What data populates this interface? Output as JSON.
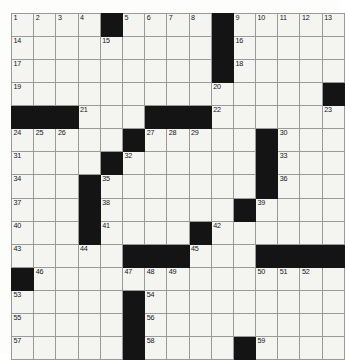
{
  "puzzle": {
    "title": "Crossword Grid",
    "rows": 15,
    "columns": 15,
    "cell_background": "#f4f4f1",
    "block_color": "#141414",
    "grid_line_color": "#9a9a98",
    "page_background": "#ffffff",
    "number_count": 59,
    "grid": [
      [
        {
          "block": false,
          "number": "1"
        },
        {
          "block": false,
          "number": "2"
        },
        {
          "block": false,
          "number": "3"
        },
        {
          "block": false,
          "number": "4"
        },
        {
          "block": true,
          "number": ""
        },
        {
          "block": false,
          "number": "5"
        },
        {
          "block": false,
          "number": "6"
        },
        {
          "block": false,
          "number": "7"
        },
        {
          "block": false,
          "number": "8"
        },
        {
          "block": true,
          "number": ""
        },
        {
          "block": false,
          "number": "9"
        },
        {
          "block": false,
          "number": "10"
        },
        {
          "block": false,
          "number": "11"
        },
        {
          "block": false,
          "number": "12"
        },
        {
          "block": false,
          "number": "13"
        }
      ],
      [
        {
          "block": false,
          "number": "14"
        },
        {
          "block": false,
          "number": ""
        },
        {
          "block": false,
          "number": ""
        },
        {
          "block": false,
          "number": ""
        },
        {
          "block": false,
          "number": "15"
        },
        {
          "block": false,
          "number": ""
        },
        {
          "block": false,
          "number": ""
        },
        {
          "block": false,
          "number": ""
        },
        {
          "block": false,
          "number": ""
        },
        {
          "block": true,
          "number": ""
        },
        {
          "block": false,
          "number": "16"
        },
        {
          "block": false,
          "number": ""
        },
        {
          "block": false,
          "number": ""
        },
        {
          "block": false,
          "number": ""
        },
        {
          "block": false,
          "number": ""
        }
      ],
      [
        {
          "block": false,
          "number": "17"
        },
        {
          "block": false,
          "number": ""
        },
        {
          "block": false,
          "number": ""
        },
        {
          "block": false,
          "number": ""
        },
        {
          "block": false,
          "number": ""
        },
        {
          "block": false,
          "number": ""
        },
        {
          "block": false,
          "number": ""
        },
        {
          "block": false,
          "number": ""
        },
        {
          "block": false,
          "number": ""
        },
        {
          "block": true,
          "number": ""
        },
        {
          "block": false,
          "number": "18"
        },
        {
          "block": false,
          "number": ""
        },
        {
          "block": false,
          "number": ""
        },
        {
          "block": false,
          "number": ""
        },
        {
          "block": false,
          "number": ""
        }
      ],
      [
        {
          "block": false,
          "number": "19"
        },
        {
          "block": false,
          "number": ""
        },
        {
          "block": false,
          "number": ""
        },
        {
          "block": false,
          "number": ""
        },
        {
          "block": false,
          "number": ""
        },
        {
          "block": false,
          "number": ""
        },
        {
          "block": false,
          "number": ""
        },
        {
          "block": false,
          "number": ""
        },
        {
          "block": false,
          "number": ""
        },
        {
          "block": false,
          "number": "20"
        },
        {
          "block": false,
          "number": ""
        },
        {
          "block": false,
          "number": ""
        },
        {
          "block": false,
          "number": ""
        },
        {
          "block": false,
          "number": ""
        },
        {
          "block": true,
          "number": ""
        }
      ],
      [
        {
          "block": true,
          "number": ""
        },
        {
          "block": true,
          "number": ""
        },
        {
          "block": true,
          "number": ""
        },
        {
          "block": false,
          "number": "21"
        },
        {
          "block": false,
          "number": ""
        },
        {
          "block": false,
          "number": ""
        },
        {
          "block": true,
          "number": ""
        },
        {
          "block": true,
          "number": ""
        },
        {
          "block": true,
          "number": ""
        },
        {
          "block": false,
          "number": "22"
        },
        {
          "block": false,
          "number": ""
        },
        {
          "block": false,
          "number": ""
        },
        {
          "block": false,
          "number": ""
        },
        {
          "block": false,
          "number": ""
        },
        {
          "block": false,
          "number": "23"
        }
      ],
      [
        {
          "block": false,
          "number": "24"
        },
        {
          "block": false,
          "number": "25"
        },
        {
          "block": false,
          "number": "26"
        },
        {
          "block": false,
          "number": ""
        },
        {
          "block": false,
          "number": ""
        },
        {
          "block": true,
          "number": ""
        },
        {
          "block": false,
          "number": "27"
        },
        {
          "block": false,
          "number": "28"
        },
        {
          "block": false,
          "number": "29"
        },
        {
          "block": false,
          "number": ""
        },
        {
          "block": false,
          "number": ""
        },
        {
          "block": true,
          "number": ""
        },
        {
          "block": false,
          "number": "30"
        },
        {
          "block": false,
          "number": ""
        },
        {
          "block": false,
          "number": ""
        }
      ],
      [
        {
          "block": false,
          "number": "31"
        },
        {
          "block": false,
          "number": ""
        },
        {
          "block": false,
          "number": ""
        },
        {
          "block": false,
          "number": ""
        },
        {
          "block": true,
          "number": ""
        },
        {
          "block": false,
          "number": "32"
        },
        {
          "block": false,
          "number": ""
        },
        {
          "block": false,
          "number": ""
        },
        {
          "block": false,
          "number": ""
        },
        {
          "block": false,
          "number": ""
        },
        {
          "block": false,
          "number": ""
        },
        {
          "block": true,
          "number": ""
        },
        {
          "block": false,
          "number": "33"
        },
        {
          "block": false,
          "number": ""
        },
        {
          "block": false,
          "number": ""
        }
      ],
      [
        {
          "block": false,
          "number": "34"
        },
        {
          "block": false,
          "number": ""
        },
        {
          "block": false,
          "number": ""
        },
        {
          "block": true,
          "number": ""
        },
        {
          "block": false,
          "number": "35"
        },
        {
          "block": false,
          "number": ""
        },
        {
          "block": false,
          "number": ""
        },
        {
          "block": false,
          "number": ""
        },
        {
          "block": false,
          "number": ""
        },
        {
          "block": false,
          "number": ""
        },
        {
          "block": false,
          "number": ""
        },
        {
          "block": true,
          "number": ""
        },
        {
          "block": false,
          "number": "36"
        },
        {
          "block": false,
          "number": ""
        },
        {
          "block": false,
          "number": ""
        }
      ],
      [
        {
          "block": false,
          "number": "37"
        },
        {
          "block": false,
          "number": ""
        },
        {
          "block": false,
          "number": ""
        },
        {
          "block": true,
          "number": ""
        },
        {
          "block": false,
          "number": "38"
        },
        {
          "block": false,
          "number": ""
        },
        {
          "block": false,
          "number": ""
        },
        {
          "block": false,
          "number": ""
        },
        {
          "block": false,
          "number": ""
        },
        {
          "block": false,
          "number": ""
        },
        {
          "block": true,
          "number": ""
        },
        {
          "block": false,
          "number": "39"
        },
        {
          "block": false,
          "number": ""
        },
        {
          "block": false,
          "number": ""
        },
        {
          "block": false,
          "number": ""
        }
      ],
      [
        {
          "block": false,
          "number": "40"
        },
        {
          "block": false,
          "number": ""
        },
        {
          "block": false,
          "number": ""
        },
        {
          "block": true,
          "number": ""
        },
        {
          "block": false,
          "number": "41"
        },
        {
          "block": false,
          "number": ""
        },
        {
          "block": false,
          "number": ""
        },
        {
          "block": false,
          "number": ""
        },
        {
          "block": true,
          "number": ""
        },
        {
          "block": false,
          "number": "42"
        },
        {
          "block": false,
          "number": ""
        },
        {
          "block": false,
          "number": ""
        },
        {
          "block": false,
          "number": ""
        },
        {
          "block": false,
          "number": ""
        },
        {
          "block": false,
          "number": ""
        }
      ],
      [
        {
          "block": false,
          "number": "43"
        },
        {
          "block": false,
          "number": ""
        },
        {
          "block": false,
          "number": ""
        },
        {
          "block": false,
          "number": "44"
        },
        {
          "block": false,
          "number": ""
        },
        {
          "block": true,
          "number": ""
        },
        {
          "block": true,
          "number": ""
        },
        {
          "block": true,
          "number": ""
        },
        {
          "block": false,
          "number": "45"
        },
        {
          "block": false,
          "number": ""
        },
        {
          "block": false,
          "number": ""
        },
        {
          "block": true,
          "number": ""
        },
        {
          "block": true,
          "number": ""
        },
        {
          "block": true,
          "number": ""
        },
        {
          "block": true,
          "number": ""
        }
      ],
      [
        {
          "block": true,
          "number": ""
        },
        {
          "block": false,
          "number": "46"
        },
        {
          "block": false,
          "number": ""
        },
        {
          "block": false,
          "number": ""
        },
        {
          "block": false,
          "number": ""
        },
        {
          "block": false,
          "number": "47"
        },
        {
          "block": false,
          "number": "48"
        },
        {
          "block": false,
          "number": "49"
        },
        {
          "block": false,
          "number": ""
        },
        {
          "block": false,
          "number": ""
        },
        {
          "block": false,
          "number": ""
        },
        {
          "block": false,
          "number": "50"
        },
        {
          "block": false,
          "number": "51"
        },
        {
          "block": false,
          "number": "52"
        },
        {
          "block": false,
          "number": ""
        }
      ],
      [
        {
          "block": false,
          "number": "53"
        },
        {
          "block": false,
          "number": ""
        },
        {
          "block": false,
          "number": ""
        },
        {
          "block": false,
          "number": ""
        },
        {
          "block": false,
          "number": ""
        },
        {
          "block": true,
          "number": ""
        },
        {
          "block": false,
          "number": "54"
        },
        {
          "block": false,
          "number": ""
        },
        {
          "block": false,
          "number": ""
        },
        {
          "block": false,
          "number": ""
        },
        {
          "block": false,
          "number": ""
        },
        {
          "block": false,
          "number": ""
        },
        {
          "block": false,
          "number": ""
        },
        {
          "block": false,
          "number": ""
        },
        {
          "block": false,
          "number": ""
        }
      ],
      [
        {
          "block": false,
          "number": "55"
        },
        {
          "block": false,
          "number": ""
        },
        {
          "block": false,
          "number": ""
        },
        {
          "block": false,
          "number": ""
        },
        {
          "block": false,
          "number": ""
        },
        {
          "block": true,
          "number": ""
        },
        {
          "block": false,
          "number": "56"
        },
        {
          "block": false,
          "number": ""
        },
        {
          "block": false,
          "number": ""
        },
        {
          "block": false,
          "number": ""
        },
        {
          "block": false,
          "number": ""
        },
        {
          "block": false,
          "number": ""
        },
        {
          "block": false,
          "number": ""
        },
        {
          "block": false,
          "number": ""
        },
        {
          "block": false,
          "number": ""
        }
      ],
      [
        {
          "block": false,
          "number": "57"
        },
        {
          "block": false,
          "number": ""
        },
        {
          "block": false,
          "number": ""
        },
        {
          "block": false,
          "number": ""
        },
        {
          "block": false,
          "number": ""
        },
        {
          "block": true,
          "number": ""
        },
        {
          "block": false,
          "number": "58"
        },
        {
          "block": false,
          "number": ""
        },
        {
          "block": false,
          "number": ""
        },
        {
          "block": false,
          "number": ""
        },
        {
          "block": true,
          "number": ""
        },
        {
          "block": false,
          "number": "59"
        },
        {
          "block": false,
          "number": ""
        },
        {
          "block": false,
          "number": ""
        },
        {
          "block": false,
          "number": ""
        }
      ]
    ]
  }
}
